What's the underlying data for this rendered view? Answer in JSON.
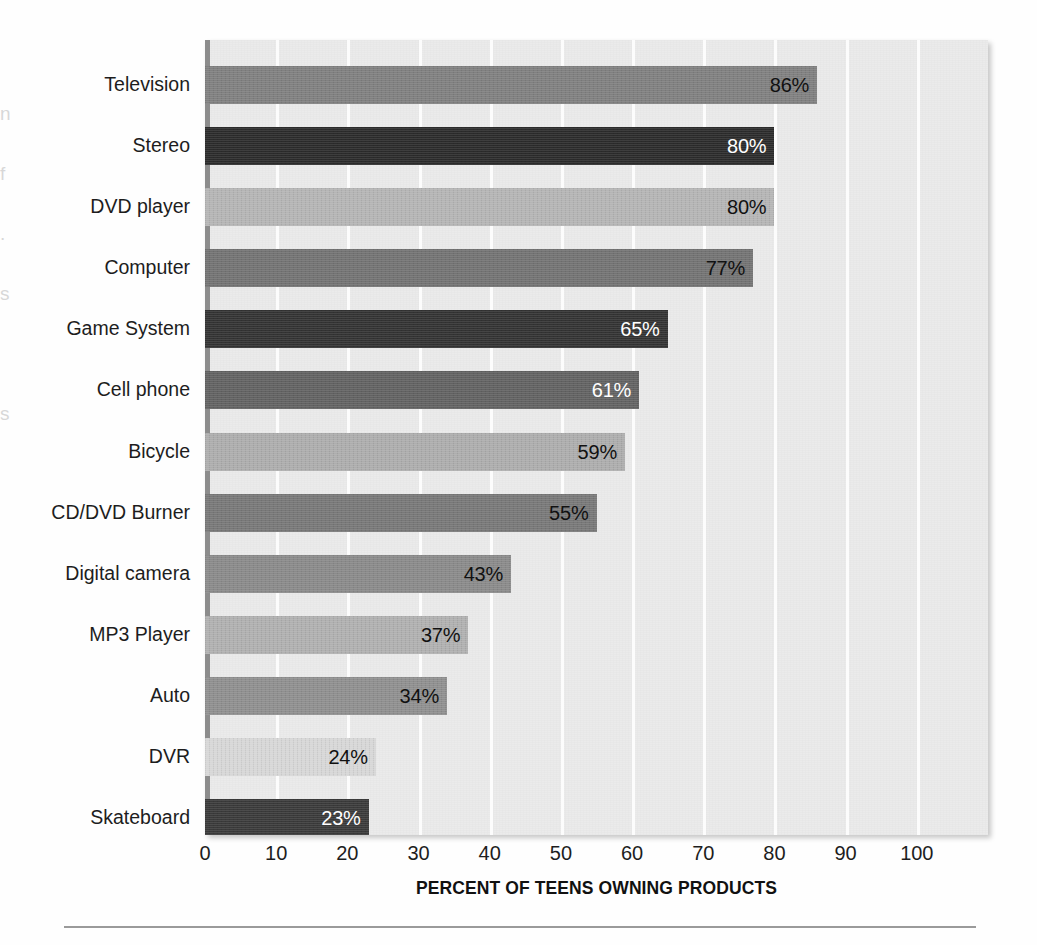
{
  "chart_data": {
    "type": "bar",
    "orientation": "horizontal",
    "title": "",
    "xlabel": "PERCENT OF TEENS OWNING PRODUCTS",
    "ylabel": "",
    "xlim": [
      0,
      110
    ],
    "xticks": [
      0,
      10,
      20,
      30,
      40,
      50,
      60,
      70,
      80,
      90,
      100
    ],
    "xtick_labels": [
      "0",
      "10",
      "20",
      "30",
      "40",
      "50",
      "60",
      "70",
      "80",
      "90",
      "100"
    ],
    "grid": "vertical-white-gridlines",
    "legend": "none",
    "value_label_suffix": "%",
    "categories": [
      "Television",
      "Stereo",
      "DVD player",
      "Computer",
      "Game System",
      "Cell phone",
      "Bicycle",
      "CD/DVD Burner",
      "Digital camera",
      "MP3 Player",
      "Auto",
      "DVR",
      "Skateboard"
    ],
    "values": [
      86,
      80,
      80,
      77,
      65,
      61,
      59,
      55,
      43,
      37,
      34,
      24,
      23
    ],
    "value_labels": [
      "86%",
      "80%",
      "80%",
      "77%",
      "65%",
      "61%",
      "59%",
      "55%",
      "43%",
      "37%",
      "34%",
      "24%",
      "23%"
    ],
    "bar_colors": [
      "#808080",
      "#2b2b2b",
      "#b5b5b5",
      "#737373",
      "#333333",
      "#626262",
      "#adadad",
      "#787878",
      "#8a8a8a",
      "#b0b0b0",
      "#8f8f8f",
      "#d7d7d7",
      "#3a3a3a"
    ],
    "value_label_colors": [
      "#111111",
      "#ffffff",
      "#111111",
      "#111111",
      "#ffffff",
      "#ffffff",
      "#111111",
      "#111111",
      "#111111",
      "#111111",
      "#111111",
      "#111111",
      "#ffffff"
    ],
    "plot_background": "#ebebeb",
    "gridline_color": "#fcfcfc",
    "axis_line_color": "#8c8c8c"
  },
  "page": {
    "margin_bleed_text": [
      "n",
      "f",
      ".",
      "s",
      "",
      "s"
    ]
  }
}
